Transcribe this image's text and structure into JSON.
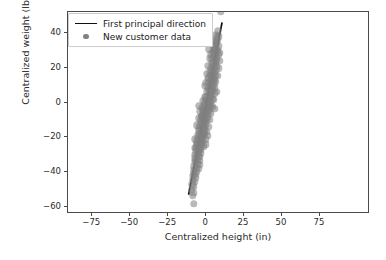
{
  "chart_data": {
    "type": "scatter",
    "title": "",
    "xlabel": "Centralized height (in)",
    "ylabel": "Centralized weight (lb)",
    "xlim": [
      -91,
      108
    ],
    "ylim": [
      -64,
      52
    ],
    "xticks": [
      -75,
      -50,
      -25,
      0,
      25,
      50,
      75
    ],
    "xtick_labels": [
      "−75",
      "−50",
      "−25",
      "0",
      "25",
      "50",
      "75"
    ],
    "yticks": [
      40,
      20,
      0,
      -20,
      -40,
      -60
    ],
    "ytick_labels": [
      "40",
      "20",
      "0",
      "−20",
      "−40",
      "−60"
    ],
    "grid": false,
    "legend_position": "upper left",
    "series": [
      {
        "name": "First principal direction",
        "type": "line",
        "color": "#111111",
        "x": [
          -11.0,
          11.2
        ],
        "y": [
          -54.0,
          46.0
        ]
      },
      {
        "name": "New customer data",
        "type": "scatter",
        "color": "#808080",
        "marker": "circle",
        "alpha": 0.55,
        "points": [
          [
            9.8,
            52.5
          ],
          [
            7.6,
            41.0
          ],
          [
            8.2,
            38.0
          ],
          [
            6.9,
            37.4
          ],
          [
            7.9,
            36.2
          ],
          [
            5.8,
            35.0
          ],
          [
            7.1,
            34.2
          ],
          [
            6.2,
            33.0
          ],
          [
            8.0,
            32.4
          ],
          [
            5.1,
            31.6
          ],
          [
            6.6,
            30.8
          ],
          [
            7.4,
            29.6
          ],
          [
            4.6,
            29.0
          ],
          [
            6.0,
            28.2
          ],
          [
            8.4,
            27.4
          ],
          [
            5.4,
            26.6
          ],
          [
            6.8,
            25.8
          ],
          [
            4.1,
            25.0
          ],
          [
            7.2,
            24.4
          ],
          [
            5.9,
            23.6
          ],
          [
            3.6,
            23.0
          ],
          [
            6.4,
            22.2
          ],
          [
            4.8,
            21.4
          ],
          [
            7.0,
            20.8
          ],
          [
            3.1,
            20.0
          ],
          [
            5.2,
            19.4
          ],
          [
            6.1,
            18.6
          ],
          [
            2.6,
            18.0
          ],
          [
            4.4,
            17.2
          ],
          [
            5.7,
            16.6
          ],
          [
            3.4,
            16.0
          ],
          [
            6.3,
            15.2
          ],
          [
            2.1,
            14.6
          ],
          [
            4.0,
            14.0
          ],
          [
            5.5,
            13.2
          ],
          [
            2.9,
            12.6
          ],
          [
            3.8,
            11.8
          ],
          [
            1.6,
            11.2
          ],
          [
            5.0,
            10.4
          ],
          [
            3.2,
            9.8
          ],
          [
            4.6,
            9.0
          ],
          [
            1.1,
            8.4
          ],
          [
            2.7,
            7.8
          ],
          [
            4.2,
            7.0
          ],
          [
            0.6,
            6.4
          ],
          [
            3.0,
            5.8
          ],
          [
            5.6,
            5.2
          ],
          [
            1.9,
            4.6
          ],
          [
            3.5,
            4.0
          ],
          [
            0.2,
            3.4
          ],
          [
            2.4,
            2.8
          ],
          [
            4.1,
            2.0
          ],
          [
            -0.3,
            1.4
          ],
          [
            1.8,
            0.8
          ],
          [
            3.3,
            0.2
          ],
          [
            -0.8,
            -0.4
          ],
          [
            1.2,
            -1.0
          ],
          [
            2.8,
            -1.6
          ],
          [
            -1.3,
            -2.2
          ],
          [
            0.8,
            -2.8
          ],
          [
            2.2,
            -3.4
          ],
          [
            -1.8,
            -4.0
          ],
          [
            0.3,
            -4.6
          ],
          [
            1.7,
            -5.2
          ],
          [
            -2.2,
            -5.8
          ],
          [
            -0.2,
            -6.4
          ],
          [
            1.2,
            -7.0
          ],
          [
            -2.7,
            -7.6
          ],
          [
            -0.7,
            -8.2
          ],
          [
            0.7,
            -8.8
          ],
          [
            -3.1,
            -9.4
          ],
          [
            -1.1,
            -10.0
          ],
          [
            0.2,
            -10.6
          ],
          [
            -3.6,
            -11.2
          ],
          [
            -1.6,
            -11.8
          ],
          [
            -0.3,
            -12.4
          ],
          [
            -4.0,
            -13.0
          ],
          [
            -2.0,
            -13.6
          ],
          [
            -0.8,
            -14.2
          ],
          [
            -4.4,
            -14.8
          ],
          [
            -2.4,
            -15.4
          ],
          [
            -1.2,
            -16.0
          ],
          [
            -4.8,
            -16.6
          ],
          [
            -2.8,
            -17.2
          ],
          [
            -1.6,
            -17.8
          ],
          [
            -5.2,
            -18.4
          ],
          [
            -3.2,
            -19.0
          ],
          [
            -2.0,
            -19.6
          ],
          [
            -5.6,
            -20.2
          ],
          [
            -3.6,
            -20.8
          ],
          [
            -2.4,
            -21.4
          ],
          [
            -6.0,
            -22.0
          ],
          [
            -4.0,
            -22.6
          ],
          [
            -2.8,
            -23.2
          ],
          [
            -6.3,
            -23.8
          ],
          [
            -4.3,
            -24.4
          ],
          [
            -3.1,
            -25.0
          ],
          [
            -1.4,
            -25.2
          ],
          [
            -6.6,
            -26.0
          ],
          [
            -4.6,
            -26.6
          ],
          [
            -3.4,
            -27.2
          ],
          [
            -6.9,
            -28.0
          ],
          [
            -4.9,
            -28.6
          ],
          [
            -3.7,
            -29.2
          ],
          [
            -7.2,
            -30.0
          ],
          [
            -5.2,
            -30.6
          ],
          [
            -4.0,
            -31.2
          ],
          [
            -7.4,
            -32.0
          ],
          [
            -5.5,
            -32.8
          ],
          [
            -4.3,
            -33.4
          ],
          [
            -7.6,
            -34.2
          ],
          [
            -5.8,
            -35.0
          ],
          [
            -4.6,
            -35.8
          ],
          [
            -7.8,
            -36.6
          ],
          [
            -6.1,
            -37.4
          ],
          [
            -4.9,
            -38.2
          ],
          [
            -8.0,
            -39.0
          ],
          [
            -6.4,
            -39.8
          ],
          [
            -8.2,
            -40.6
          ],
          [
            -6.8,
            -41.4
          ],
          [
            -8.6,
            -42.2
          ],
          [
            -7.2,
            -43.2
          ],
          [
            -8.9,
            -44.4
          ],
          [
            -7.6,
            -45.6
          ],
          [
            -9.2,
            -47.0
          ],
          [
            -8.0,
            -48.4
          ],
          [
            -9.4,
            -50.0
          ],
          [
            -8.4,
            -52.0
          ],
          [
            -8.6,
            -53.4
          ],
          [
            -8.2,
            -58.0
          ],
          [
            4.9,
            12.4
          ],
          [
            5.8,
            8.8
          ],
          [
            6.6,
            6.2
          ],
          [
            2.0,
            6.8
          ],
          [
            -1.0,
            3.0
          ],
          [
            0.4,
            -16.8
          ],
          [
            -0.4,
            -21.0
          ],
          [
            1.0,
            -19.2
          ],
          [
            -1.8,
            -12.0
          ],
          [
            -5.0,
            -9.0
          ],
          [
            -3.0,
            -3.0
          ],
          [
            -2.2,
            1.0
          ],
          [
            -0.6,
            9.6
          ],
          [
            1.4,
            13.8
          ],
          [
            3.9,
            18.0
          ],
          [
            6.0,
            12.0
          ],
          [
            7.4,
            15.4
          ],
          [
            8.0,
            19.6
          ],
          [
            8.6,
            23.8
          ],
          [
            8.8,
            28.6
          ],
          [
            -6.0,
            -13.0
          ],
          [
            -7.0,
            -21.0
          ],
          [
            -5.4,
            -28.0
          ],
          [
            -6.6,
            -33.0
          ],
          [
            -4.2,
            -18.0
          ],
          [
            2.6,
            25.4
          ],
          [
            3.2,
            27.8
          ],
          [
            1.4,
            21.2
          ],
          [
            0.6,
            16.4
          ],
          [
            -0.2,
            11.4
          ],
          [
            4.4,
            33.4
          ],
          [
            5.2,
            30.2
          ],
          [
            2.2,
            30.6
          ],
          [
            3.8,
            35.8
          ],
          [
            6.2,
            39.0
          ],
          [
            -2.6,
            -8.0
          ],
          [
            -3.8,
            -5.0
          ],
          [
            -4.6,
            -2.0
          ],
          [
            -1.4,
            -6.0
          ],
          [
            -0.9,
            -18.0
          ],
          [
            0.0,
            -24.0
          ],
          [
            1.6,
            -14.0
          ],
          [
            2.4,
            -10.0
          ],
          [
            3.0,
            -6.2
          ],
          [
            4.0,
            -2.4
          ],
          [
            4.8,
            1.6
          ],
          [
            5.4,
            -3.6
          ],
          [
            -5.8,
            -24.0
          ],
          [
            -7.0,
            -26.0
          ],
          [
            -3.4,
            -22.0
          ]
        ]
      }
    ]
  },
  "axes": {
    "xlabel": "Centralized height (in)",
    "ylabel": "Centralized weight (lb)"
  },
  "legend": {
    "items": [
      {
        "label": "First principal direction",
        "key": "line"
      },
      {
        "label": "New customer data",
        "key": "dot"
      }
    ]
  }
}
